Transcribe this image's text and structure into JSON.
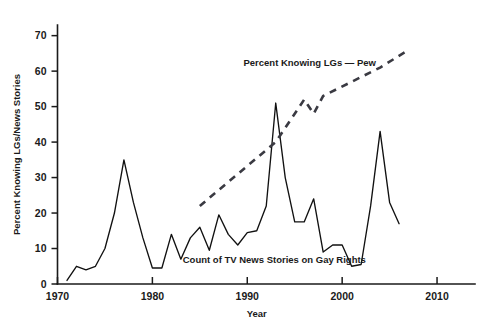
{
  "chart_data": {
    "type": "line",
    "title": "",
    "xlabel": "Year",
    "ylabel": "Percent Knowing LGs/News Stories",
    "xlim": [
      1970,
      2014
    ],
    "ylim": [
      0,
      73
    ],
    "xticks": [
      1970,
      1980,
      1990,
      2000,
      2010
    ],
    "xtick_labels": [
      "1970",
      "1980",
      "1990",
      "2000",
      "2010"
    ],
    "yticks": [
      0,
      10,
      20,
      30,
      40,
      50,
      60,
      70
    ],
    "ytick_labels": [
      "0",
      "10",
      "20",
      "30",
      "40",
      "50",
      "60",
      "70"
    ],
    "grid": false,
    "legend_position": "inline-annotations",
    "series": [
      {
        "name": "Count of TV News Stories on Gay Rights",
        "style": "solid",
        "annotation": "Count of TV News Stories on Gay Rights",
        "x": [
          1971,
          1972,
          1973,
          1974,
          1975,
          1976,
          1977,
          1978,
          1979,
          1980,
          1981,
          1982,
          1983,
          1984,
          1985,
          1986,
          1987,
          1988,
          1989,
          1990,
          1991,
          1992,
          1993,
          1994,
          1995,
          1996,
          1997,
          1998,
          1999,
          2000,
          2001,
          2002,
          2003,
          2004,
          2005,
          2006
        ],
        "y": [
          1,
          5,
          4,
          5,
          10,
          20,
          35,
          23,
          13,
          4.5,
          4.5,
          14,
          7,
          13,
          16,
          9.5,
          19.5,
          14,
          11,
          14.5,
          15,
          22,
          51,
          30,
          17.5,
          17.5,
          24,
          9,
          11,
          11,
          5,
          5.5,
          22,
          43,
          23,
          17
        ]
      },
      {
        "name": "Percent Knowing LGs — Pew",
        "style": "dashed",
        "annotation": "Percent Knowing LGs — Pew",
        "x": [
          1985,
          1993,
          1996,
          1997,
          1998,
          2001,
          2004,
          2007
        ],
        "y": [
          22,
          40,
          52,
          48,
          53,
          57,
          61,
          66
        ]
      }
    ],
    "annotations": [
      {
        "text": "Percent Knowing LGs — Pew",
        "x": 1989.6,
        "y": 61.5,
        "anchor": "start"
      },
      {
        "text": "Count of TV News Stories on Gay Rights",
        "x": 1983.2,
        "y": 6.0,
        "anchor": "start"
      }
    ]
  }
}
